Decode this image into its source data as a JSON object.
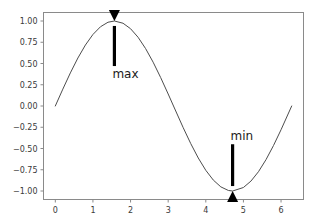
{
  "chart_data": {
    "type": "line",
    "title": "",
    "xlabel": "",
    "ylabel": "",
    "xlim": [
      -0.314,
      6.597
    ],
    "ylim": [
      -1.1,
      1.1
    ],
    "grid": false,
    "legend": null,
    "x_ticks": [
      "0",
      "1",
      "2",
      "3",
      "4",
      "5",
      "6"
    ],
    "x_tick_values": [
      0,
      1,
      2,
      3,
      4,
      5,
      6
    ],
    "y_ticks": [
      "1.00",
      "0.75",
      "0.50",
      "0.25",
      "0.00",
      "−0.25",
      "−0.50",
      "−0.75",
      "−1.00"
    ],
    "y_tick_values": [
      1.0,
      0.75,
      0.5,
      0.25,
      0.0,
      -0.25,
      -0.5,
      -0.75,
      -1.0
    ],
    "series": [
      {
        "name": "sin(x)",
        "color": "#4d4d4d",
        "linewidth": 1,
        "x": [
          0.0,
          0.2,
          0.4,
          0.6,
          0.8,
          1.0,
          1.2,
          1.4,
          1.5708,
          1.8,
          2.0,
          2.2,
          2.4,
          2.6,
          2.8,
          3.0,
          3.1416,
          3.4,
          3.6,
          3.8,
          4.0,
          4.2,
          4.4,
          4.6,
          4.7124,
          5.0,
          5.2,
          5.4,
          5.6,
          5.8,
          6.0,
          6.2832
        ],
        "y": [
          0.0,
          0.1987,
          0.3894,
          0.5646,
          0.7174,
          0.8415,
          0.932,
          0.9854,
          1.0,
          0.9738,
          0.9093,
          0.8085,
          0.6755,
          0.5155,
          0.335,
          0.1411,
          0.0,
          -0.2555,
          -0.4425,
          -0.6119,
          -0.7568,
          -0.8716,
          -0.9516,
          -0.9937,
          -1.0,
          -0.9589,
          -0.8835,
          -0.7728,
          -0.6313,
          -0.4646,
          -0.2794,
          0.0
        ]
      }
    ],
    "annotations": [
      {
        "label": "max",
        "point_x": 1.5708,
        "point_y": 1.0,
        "text_x": 1.5708,
        "text_y": 0.47,
        "arrow_direction": "up",
        "arrow_color": "#000000",
        "text_align": "left"
      },
      {
        "label": "min",
        "point_x": 4.7124,
        "point_y": -1.0,
        "text_x": 4.7124,
        "text_y": -0.45,
        "arrow_direction": "down",
        "arrow_color": "#000000",
        "text_align": "left"
      }
    ],
    "axes_frame_color": "#8a8a8a",
    "background_color": "#ffffff"
  },
  "figure": {
    "background_color": "#ffffff"
  }
}
